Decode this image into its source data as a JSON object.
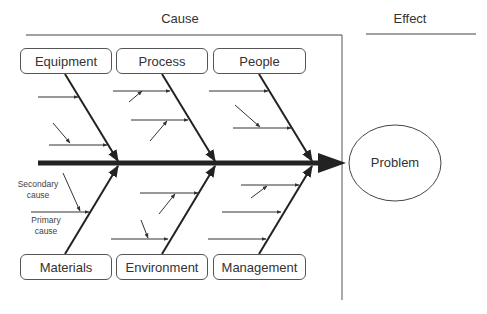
{
  "header": {
    "cause_label": "Cause",
    "effect_label": "Effect"
  },
  "categories": {
    "top": [
      {
        "label": "Equipment"
      },
      {
        "label": "Process"
      },
      {
        "label": "People"
      }
    ],
    "bottom": [
      {
        "label": "Materials"
      },
      {
        "label": "Environment"
      },
      {
        "label": "Management"
      }
    ]
  },
  "annotations": {
    "secondary_cause": "Secondary cause",
    "secondary_line1": "Secondary",
    "secondary_line2": "cause",
    "primary_line1": "Primary",
    "primary_line2": "cause"
  },
  "effect": {
    "label": "Problem"
  },
  "colors": {
    "line": "#222222",
    "text": "#333333",
    "box_border": "#555555",
    "background": "#ffffff"
  }
}
